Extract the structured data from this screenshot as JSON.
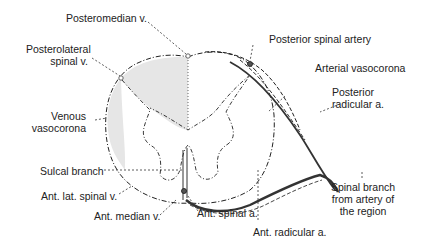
{
  "colors": {
    "ink": "#222222",
    "white_matter_shade": "#e6e6e6",
    "background": "#ffffff",
    "artery": "#333333"
  },
  "labels": {
    "posteromedian_v": "Posteromedian v.",
    "posterolateral_v_line1": "Posterolateral",
    "posterolateral_v_line2": "spinal v.",
    "venous_vasocorona_line1": "Venous",
    "venous_vasocorona_line2": "vasocorona",
    "sulcal_branch": "Sulcal branch",
    "ant_lat_spinal_v": "Ant. lat. spinal v.",
    "ant_median_v": "Ant. median v.",
    "posterior_spinal_artery": "Posterior spinal artery",
    "arterial_vasocorona": "Arterial vasocorona",
    "posterior_radicular_line1": "Posterior",
    "posterior_radicular_line2": "radicular a.",
    "ant_spinal_a": "Ant. spinal a.",
    "spinal_branch_line1": "Spinal branch",
    "spinal_branch_line2": "from artery of",
    "spinal_branch_line3": "the region",
    "ant_radicular_a": "Ant. radicular a."
  }
}
